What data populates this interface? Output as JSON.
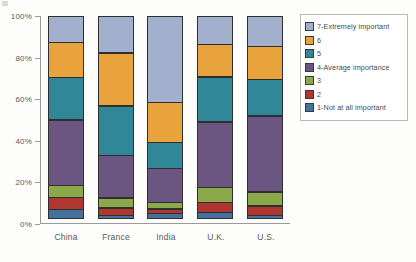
{
  "chart_data": {
    "type": "bar",
    "stacked": true,
    "stack_mode": "percent",
    "title": "",
    "xlabel": "",
    "ylabel": "",
    "ylim": [
      0,
      100
    ],
    "ytick_labels": [
      "0%",
      "20%",
      "40%",
      "60%",
      "80%",
      "100%"
    ],
    "ytick_values": [
      0,
      20,
      40,
      60,
      80,
      100
    ],
    "grid": false,
    "legend_position": "right",
    "categories": [
      "China",
      "France",
      "India",
      "U.K.",
      "U.S."
    ],
    "series": [
      {
        "name": "1-Not at all important",
        "color": "#44719b",
        "values": [
          5,
          2,
          3,
          3.5,
          2
        ]
      },
      {
        "name": "2",
        "color": "#b0372f",
        "values": [
          6,
          4,
          2.5,
          5,
          5
        ]
      },
      {
        "name": "3",
        "color": "#8ba84b",
        "values": [
          6,
          5,
          3.5,
          7.5,
          7
        ]
      },
      {
        "name": "4-Average importance",
        "color": "#6a5680",
        "values": [
          32,
          21,
          16.5,
          32,
          37
        ]
      },
      {
        "name": "5",
        "color": "#2f8797",
        "values": [
          21,
          24,
          13,
          22,
          18
        ]
      },
      {
        "name": "6",
        "color": "#e8a33d",
        "values": [
          17,
          26,
          19.5,
          16,
          16
        ]
      },
      {
        "name": "7-Extremely important",
        "color": "#a3b0cd",
        "values": [
          13,
          18,
          42,
          14,
          15
        ]
      }
    ]
  },
  "legend": {
    "items": [
      {
        "label": "7-Extremely important",
        "color": "#a3b0cd"
      },
      {
        "label": "6",
        "color": "#e8a33d"
      },
      {
        "label": "5",
        "color": "#2f8797"
      },
      {
        "label": "4-Average importance",
        "color": "#6a5680"
      },
      {
        "label": "3",
        "color": "#8ba84b"
      },
      {
        "label": "2",
        "color": "#b0372f"
      },
      {
        "label": "1-Not at all important",
        "color": "#44719b"
      }
    ]
  }
}
